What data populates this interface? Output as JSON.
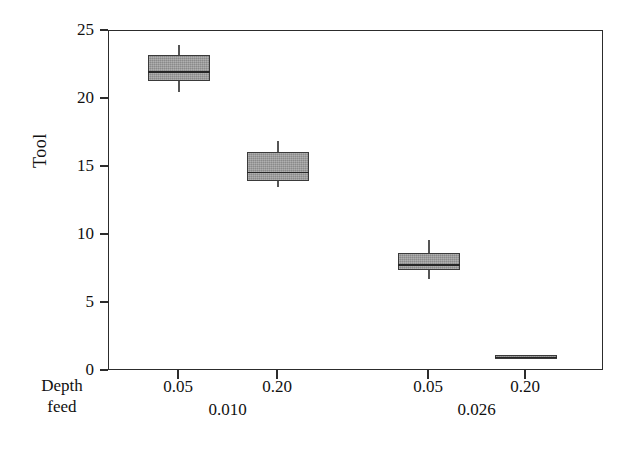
{
  "chart_data": {
    "type": "box",
    "title": "",
    "xlabel": "",
    "ylabel": "Tool",
    "ylim": [
      0,
      25
    ],
    "yticks": [
      0,
      5,
      10,
      15,
      20,
      25
    ],
    "grid": false,
    "legend": "none",
    "row_labels": [
      "Depth",
      "feed"
    ],
    "x_tick_labels": [
      "0.05",
      "0.20",
      "0.05",
      "0.20"
    ],
    "group_labels": [
      "0.010",
      "0.026"
    ],
    "categories": [
      "Depth 0.010 / feed 0.05",
      "Depth 0.010 / feed 0.20",
      "Depth 0.026 / feed 0.05",
      "Depth 0.026 / feed 0.20"
    ],
    "boxes": [
      {
        "label": "0.05",
        "group": "0.010",
        "whisker_low": 20.5,
        "q1": 21.3,
        "median": 22.0,
        "q3": 23.2,
        "whisker_high": 24.0
      },
      {
        "label": "0.20",
        "group": "0.010",
        "whisker_low": 13.5,
        "q1": 14.0,
        "median": 14.6,
        "q3": 16.1,
        "whisker_high": 16.9
      },
      {
        "label": "0.05",
        "group": "0.026",
        "whisker_low": 6.8,
        "q1": 7.4,
        "median": 7.8,
        "q3": 8.7,
        "whisker_high": 9.6
      },
      {
        "label": "0.20",
        "group": "0.026",
        "whisker_low": 0.9,
        "q1": 0.9,
        "median": 1.0,
        "q3": 1.2,
        "whisker_high": 1.2
      }
    ],
    "colors": {
      "box_fill": "#9a9a9a",
      "box_stroke": "#3a3a3a",
      "median": "#262626",
      "axis": "#2c2c2c",
      "background": "#ffffff"
    }
  }
}
